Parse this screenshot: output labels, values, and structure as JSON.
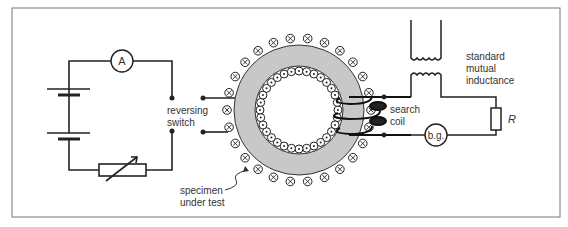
{
  "diagram": {
    "labels": {
      "ammeter": "A",
      "reversing_switch_line1": "reversing",
      "reversing_switch_line2": "switch",
      "specimen_line1": "specimen",
      "specimen_line2": "under test",
      "search_coil_line1": "search",
      "search_coil_line2": "coil",
      "mutual_line1": "standard",
      "mutual_line2": "mutual",
      "mutual_line3": "inductance",
      "galvanometer": "b.g.",
      "resistor": "R"
    },
    "components": [
      "battery",
      "ammeter",
      "variable-resistor",
      "reversing-switch",
      "toroid-specimen",
      "magnetising-winding",
      "search-coil",
      "standard-mutual-inductance",
      "resistor",
      "ballistic-galvanometer"
    ],
    "colors": {
      "line": "#222222",
      "ring": "#c8c8c8",
      "frame": "#777777"
    }
  }
}
